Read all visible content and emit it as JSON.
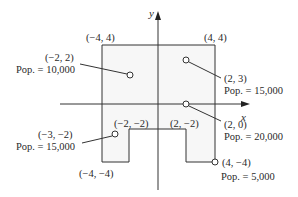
{
  "axes": {
    "x_label": "x",
    "y_label": "y"
  },
  "corners": {
    "top_left": "(−4, 4)",
    "top_right": "(4, 4)",
    "bottom_left": "(−4, −4)",
    "notch_left": "(−2, −2)",
    "notch_right": "(2, −2)"
  },
  "cities": [
    {
      "coord": "(−2, 2)",
      "pop": "Pop. = 10,000"
    },
    {
      "coord": "(2, 3)",
      "pop": "Pop. = 15,000"
    },
    {
      "coord": "(2, 0)",
      "pop": "Pop. = 20,000"
    },
    {
      "coord": "(−3, −2)",
      "pop": "Pop. = 15,000"
    },
    {
      "coord": "(4, −4)",
      "pop": "Pop. = 5,000"
    }
  ],
  "colors": {
    "line": "#333333",
    "fill": "#f7f7f7"
  }
}
